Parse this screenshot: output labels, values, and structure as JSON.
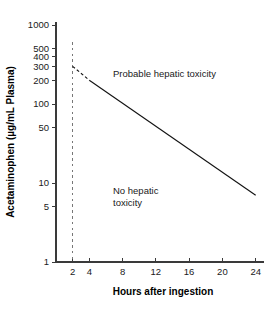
{
  "chart_data": {
    "type": "line",
    "title": "",
    "xlabel": "Hours after ingestion",
    "ylabel": "Acetaminophen (µg/mL Plasma)",
    "xlim": [
      0,
      25
    ],
    "ylim": [
      1,
      1000
    ],
    "yscale": "log",
    "xscale": "linear",
    "grid": false,
    "legend": null,
    "xticks": [
      2,
      4,
      8,
      12,
      16,
      20,
      24
    ],
    "xtick_labels": [
      "2",
      "4",
      "8",
      "12",
      "16",
      "20",
      "24"
    ],
    "yticks": [
      1000,
      500,
      400,
      300,
      200,
      100,
      50,
      10,
      5,
      1
    ],
    "ytick_labels": [
      "1000",
      "500",
      "400",
      "300",
      "200",
      "100",
      "50",
      "10",
      "5",
      "1"
    ],
    "series": [
      {
        "name": "treatment-line-dashed",
        "style": "dashed",
        "x": [
          2,
          4
        ],
        "values": [
          300,
          200
        ]
      },
      {
        "name": "treatment-line-solid",
        "style": "solid",
        "x": [
          4,
          24
        ],
        "values": [
          200,
          7
        ]
      }
    ],
    "reference_lines": [
      {
        "name": "four-hour-marker",
        "orientation": "vertical",
        "x": 2,
        "style": "dashed",
        "color": "#777777"
      }
    ],
    "annotations": [
      {
        "name": "probable-toxicity-label",
        "text": "Probable  hepatic toxicity",
        "x": 7.5,
        "y": 330
      },
      {
        "name": "no-toxicity-label",
        "line1": "No hepatic",
        "line2": "toxicity",
        "x": 7.0,
        "y": 13
      }
    ]
  },
  "axis_titles": {
    "x": "Hours after ingestion",
    "y": "Acetaminophen (µg/mL Plasma)"
  },
  "colors": {
    "background": "#ffffff",
    "axis": "#3a3a3a",
    "series": "#111111",
    "reference": "#777777",
    "text": "#1a1a1a"
  }
}
